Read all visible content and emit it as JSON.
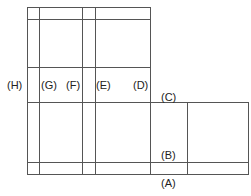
{
  "diagram": {
    "type": "box-net-template",
    "line_color": "#555555",
    "labels": [
      {
        "id": "H",
        "text": "(H)",
        "x": 7,
        "y": 79
      },
      {
        "id": "G",
        "text": "(G)",
        "x": 41,
        "y": 79
      },
      {
        "id": "F",
        "text": "(F)",
        "x": 66,
        "y": 79
      },
      {
        "id": "E",
        "text": "(E)",
        "x": 96,
        "y": 79
      },
      {
        "id": "D",
        "text": "(D)",
        "x": 133,
        "y": 79
      },
      {
        "id": "C",
        "text": "(C)",
        "x": 161,
        "y": 91
      },
      {
        "id": "B",
        "text": "(B)",
        "x": 161,
        "y": 149
      },
      {
        "id": "A",
        "text": "(A)",
        "x": 161,
        "y": 177
      }
    ]
  }
}
